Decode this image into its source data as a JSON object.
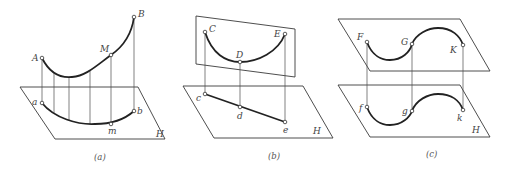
{
  "panels": [
    {
      "id": "a",
      "caption": "(a)",
      "plane_label": "H",
      "space_points": [
        {
          "label": "A"
        },
        {
          "label": "M"
        },
        {
          "label": "B"
        }
      ],
      "projection_points": [
        {
          "label": "a"
        },
        {
          "label": "m"
        },
        {
          "label": "b"
        }
      ],
      "description": "Space curve AB with point M projected onto plane H as curve amb"
    },
    {
      "id": "b",
      "caption": "(b)",
      "plane_label": "H",
      "space_points": [
        {
          "label": "C"
        },
        {
          "label": "D"
        },
        {
          "label": "E"
        }
      ],
      "projection_points": [
        {
          "label": "c"
        },
        {
          "label": "d"
        },
        {
          "label": "e"
        }
      ],
      "description": "Plane curve CDE in a plane perpendicular to H projects to straight line cde"
    },
    {
      "id": "c",
      "caption": "(c)",
      "plane_label": "H",
      "space_points": [
        {
          "label": "F"
        },
        {
          "label": "G"
        },
        {
          "label": "K"
        }
      ],
      "projection_points": [
        {
          "label": "f"
        },
        {
          "label": "g"
        },
        {
          "label": "k"
        }
      ],
      "description": "Plane curve FGK in a plane parallel to H projects to congruent curve fgk"
    }
  ],
  "colors": {
    "line": "#222222",
    "background": "#ffffff"
  }
}
